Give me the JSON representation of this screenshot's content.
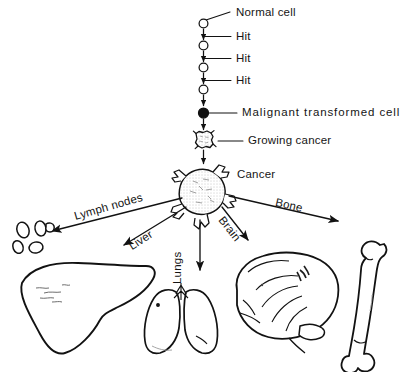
{
  "figure": {
    "ink_color": "#121212",
    "background_color": "#ffffff"
  },
  "progression": {
    "labels": {
      "normal_cell": "Normal cell",
      "hit_1": "Hit",
      "hit_2": "Hit",
      "hit_3": "Hit",
      "malignant": "Malignant  transformed  cell",
      "growing_cancer": "Growing cancer",
      "cancer": "Cancer"
    },
    "stages": [
      {
        "name": "normal-cell",
        "marker": "open-circle"
      },
      {
        "name": "hit-stage-1",
        "marker": "open-circle"
      },
      {
        "name": "hit-stage-2",
        "marker": "open-circle"
      },
      {
        "name": "hit-stage-3",
        "marker": "open-circle"
      },
      {
        "name": "malignant-transformed-cell",
        "marker": "filled-circle"
      },
      {
        "name": "growing-cancer",
        "marker": "small-spiky-mass"
      },
      {
        "name": "cancer",
        "marker": "large-spiky-mass"
      }
    ]
  },
  "metastasis": {
    "routes": [
      {
        "name": "lymph-nodes",
        "label": "Lymph nodes",
        "direction": "down-left"
      },
      {
        "name": "liver",
        "label": "Liver",
        "direction": "down-left"
      },
      {
        "name": "lungs",
        "label": "Lungs",
        "direction": "down"
      },
      {
        "name": "brain",
        "label": "Brain",
        "direction": "down-right"
      },
      {
        "name": "bone",
        "label": "Bone",
        "direction": "down-right"
      }
    ],
    "organs": [
      {
        "name": "lymph-nodes-illustration"
      },
      {
        "name": "liver-illustration"
      },
      {
        "name": "lungs-illustration"
      },
      {
        "name": "brain-illustration"
      },
      {
        "name": "bone-illustration"
      }
    ]
  }
}
